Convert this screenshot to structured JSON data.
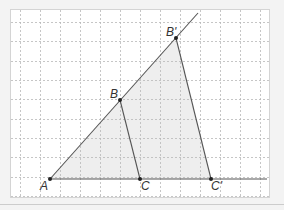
{
  "diagram": {
    "type": "geometry-figure",
    "colors": {
      "page_background": "#f3f3f3",
      "paper": "#ffffff",
      "frame": "#d4d4d4",
      "grid": "#b8b8b8",
      "shade": "#eeeeee",
      "line": "#555555",
      "point": "#222222",
      "label": "#333333",
      "separator": "#cccccc"
    },
    "frame": {
      "x": 10,
      "y": 9,
      "width": 259,
      "height": 188
    },
    "grid": {
      "vertical_x": [
        20,
        40,
        60,
        80,
        100,
        120,
        140,
        160,
        180,
        200,
        220,
        240,
        260
      ],
      "horizontal_y": [
        22,
        41,
        61,
        80,
        99,
        119,
        138,
        157,
        177,
        196
      ]
    },
    "points": [
      {
        "id": "A",
        "label": "A",
        "x": 50,
        "y": 179,
        "label_x": 40,
        "label_y": 190
      },
      {
        "id": "B",
        "label": "B",
        "x": 120,
        "y": 100,
        "label_x": 110,
        "label_y": 98
      },
      {
        "id": "C",
        "label": "C",
        "x": 140,
        "y": 179,
        "label_x": 141,
        "label_y": 190
      },
      {
        "id": "Bp",
        "label": "B'",
        "x": 176,
        "y": 38,
        "label_x": 166,
        "label_y": 36
      },
      {
        "id": "Cp",
        "label": "C'",
        "x": 211,
        "y": 179,
        "label_x": 211,
        "label_y": 190
      }
    ],
    "segments": [
      {
        "name": "ray-AB-prime",
        "from": [
          50,
          179
        ],
        "to": [
          198,
          13
        ]
      },
      {
        "name": "baseline-AC-prime",
        "from": [
          50,
          179
        ],
        "to": [
          267,
          179
        ]
      },
      {
        "name": "segment-BC",
        "from": [
          120,
          100
        ],
        "to": [
          140,
          179
        ]
      },
      {
        "name": "segment-B-prime-C-prime",
        "from": [
          176,
          38
        ],
        "to": [
          211,
          179
        ]
      }
    ],
    "shaded_triangle": [
      [
        50,
        179
      ],
      [
        176,
        38
      ],
      [
        211,
        179
      ]
    ],
    "separator": {
      "y": 204
    }
  }
}
